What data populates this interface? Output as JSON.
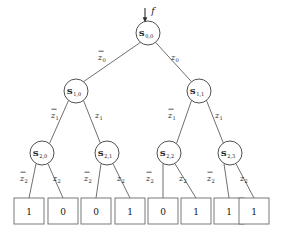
{
  "diagram": {
    "input_label": "f",
    "colors": {
      "line": "#4a4a4a",
      "node_stroke": "#3c3c3c",
      "box_stroke": "#6a6a6a",
      "text": "#1a1a1a",
      "background": "#ffffff"
    },
    "nodes": [
      {
        "id": "s00",
        "main": "S",
        "sub": "0,0",
        "cx": 148,
        "cy": 33,
        "r": 12
      },
      {
        "id": "s10",
        "main": "S",
        "sub": "1,0",
        "cx": 76,
        "cy": 91,
        "r": 12
      },
      {
        "id": "s11",
        "main": "S",
        "sub": "1,1",
        "cx": 199,
        "cy": 91,
        "r": 12
      },
      {
        "id": "s20",
        "main": "S",
        "sub": "2,0",
        "cx": 42,
        "cy": 153,
        "r": 12
      },
      {
        "id": "s21",
        "main": "S",
        "sub": "2,1",
        "cx": 107,
        "cy": 153,
        "r": 12
      },
      {
        "id": "s22",
        "main": "S",
        "sub": "2,2",
        "cx": 169,
        "cy": 153,
        "r": 12
      },
      {
        "id": "s23",
        "main": "S",
        "sub": "2,3",
        "cx": 230,
        "cy": 153,
        "r": 12
      }
    ],
    "edges": [
      {
        "id": "e-s00-s10",
        "from": "s00",
        "to": "s10",
        "label_main": "z",
        "label_sub": "0",
        "negated": true,
        "lx": 102,
        "ly": 57
      },
      {
        "id": "e-s00-s11",
        "from": "s00",
        "to": "s11",
        "label_main": "z",
        "label_sub": "0",
        "negated": false,
        "lx": 175,
        "ly": 57
      },
      {
        "id": "e-s10-s20",
        "from": "s10",
        "to": "s20",
        "label_main": "z",
        "label_sub": "1",
        "negated": true,
        "lx": 55,
        "ly": 115
      },
      {
        "id": "e-s10-s21",
        "from": "s10",
        "to": "s21",
        "label_main": "z",
        "label_sub": "1",
        "negated": false,
        "lx": 99,
        "ly": 115
      },
      {
        "id": "e-s11-s22",
        "from": "s11",
        "to": "s22",
        "label_main": "z",
        "label_sub": "1",
        "negated": true,
        "lx": 172,
        "ly": 115
      },
      {
        "id": "e-s11-s23",
        "from": "s11",
        "to": "s23",
        "label_main": "z",
        "label_sub": "1",
        "negated": false,
        "lx": 219,
        "ly": 115
      },
      {
        "id": "e-s20-l0",
        "from": "s20",
        "to": "leaf0",
        "label_main": "z",
        "label_sub": "2",
        "negated": true,
        "lx": 24,
        "ly": 178
      },
      {
        "id": "e-s20-l1",
        "from": "s20",
        "to": "leaf1",
        "label_main": "z",
        "label_sub": "2",
        "negated": false,
        "lx": 57,
        "ly": 178
      },
      {
        "id": "e-s21-l2",
        "from": "s21",
        "to": "leaf2",
        "label_main": "z",
        "label_sub": "2",
        "negated": true,
        "lx": 88,
        "ly": 178
      },
      {
        "id": "e-s21-l3",
        "from": "s21",
        "to": "leaf3",
        "label_main": "z",
        "label_sub": "2",
        "negated": false,
        "lx": 121,
        "ly": 178
      },
      {
        "id": "e-s22-l4",
        "from": "s22",
        "to": "leaf4",
        "label_main": "z",
        "label_sub": "2",
        "negated": true,
        "lx": 150,
        "ly": 178
      },
      {
        "id": "e-s22-l5",
        "from": "s22",
        "to": "leaf5",
        "label_main": "z",
        "label_sub": "2",
        "negated": false,
        "lx": 183,
        "ly": 178
      },
      {
        "id": "e-s23-l6",
        "from": "s23",
        "to": "leaf6",
        "label_main": "z",
        "label_sub": "2",
        "negated": true,
        "lx": 211,
        "ly": 178
      },
      {
        "id": "e-s23-l7",
        "from": "s23",
        "to": "leaf7",
        "label_main": "z",
        "label_sub": "2",
        "negated": false,
        "lx": 244,
        "ly": 178
      }
    ],
    "leaves": [
      {
        "id": "leaf0",
        "value": "1",
        "cx": 29,
        "cy": 211
      },
      {
        "id": "leaf1",
        "value": "0",
        "cx": 63,
        "cy": 211
      },
      {
        "id": "leaf2",
        "value": "0",
        "cx": 96,
        "cy": 211
      },
      {
        "id": "leaf3",
        "value": "1",
        "cx": 130,
        "cy": 211
      },
      {
        "id": "leaf4",
        "value": "0",
        "cx": 163,
        "cy": 211
      },
      {
        "id": "leaf5",
        "value": "1",
        "cx": 196,
        "cy": 211
      },
      {
        "id": "leaf6",
        "value": "1",
        "cx": 229,
        "cy": 211
      },
      {
        "id": "leaf7",
        "value": "1",
        "cx": 254,
        "cy": 211
      }
    ],
    "leaf_box": {
      "width": 30,
      "height": 26
    }
  }
}
